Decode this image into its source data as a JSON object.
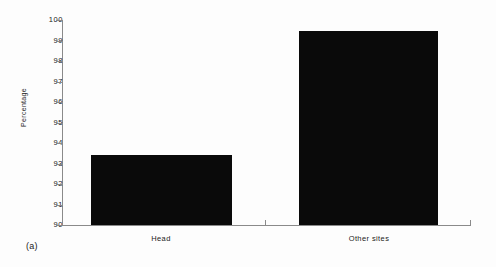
{
  "figure": {
    "caption": "(a)"
  },
  "chart_data": {
    "type": "bar",
    "title": "",
    "xlabel": "",
    "ylabel": "Percentage",
    "categories": [
      "Head",
      "Other sites"
    ],
    "values": [
      93.4,
      99.45
    ],
    "ylim": [
      90,
      100
    ],
    "yticks": [
      90,
      91,
      92,
      93,
      94,
      95,
      96,
      97,
      98,
      99,
      100
    ],
    "ytick_labels": [
      "90",
      "91",
      "92",
      "93",
      "94",
      "95",
      "96",
      "97",
      "98",
      "99",
      "100"
    ],
    "grid": false,
    "legend": false,
    "bar_color": "#0a0a0a",
    "axis_color": "#8a8a8a"
  }
}
